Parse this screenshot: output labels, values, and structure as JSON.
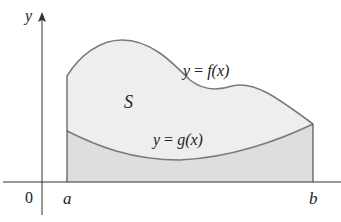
{
  "diagram": {
    "type": "area-between-curves",
    "axes": {
      "y_label": "y",
      "origin_label": "0"
    },
    "bounds": {
      "left_label": "a",
      "right_label": "b"
    },
    "curves": {
      "upper": {
        "label_lhs": "y",
        "label_eq": "=",
        "label_rhs": "f(x)",
        "name": "f"
      },
      "lower": {
        "label_lhs": "y",
        "label_eq": "=",
        "label_rhs": "g(x)",
        "name": "g"
      }
    },
    "region_label": "S",
    "colors": {
      "curve": "#7a7a7a",
      "axis": "#333333",
      "region_upper_fill": "#eeeeee",
      "region_lower_fill": "#dedede",
      "text": "#222222"
    }
  }
}
